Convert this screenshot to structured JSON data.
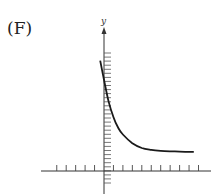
{
  "figure": {
    "panel_label": "(F)",
    "y_axis_label": "y"
  },
  "chart_data": {
    "type": "line",
    "title": "(F)",
    "xlabel": "",
    "ylabel": "y",
    "grid": false,
    "legend": null,
    "x_ticks_left_of_origin": 5,
    "x_ticks_right_of_origin": 10,
    "y_ticks_count": 33,
    "xlim": [
      -5,
      10
    ],
    "ylim": [
      -2,
      12
    ],
    "series": [
      {
        "name": "f(x)",
        "x": [
          -0.4,
          0,
          0.5,
          1,
          1.5,
          2,
          3,
          4,
          5,
          6,
          7,
          8,
          9,
          9.5
        ],
        "y": [
          11.5,
          9.5,
          7.2,
          5.6,
          4.5,
          3.8,
          2.9,
          2.4,
          2.2,
          2.1,
          2.05,
          2.02,
          2.0,
          2.0
        ]
      }
    ],
    "asymptote_y": 2,
    "colors": {
      "curve": "#1a1a1a",
      "axes": "#333333"
    }
  }
}
